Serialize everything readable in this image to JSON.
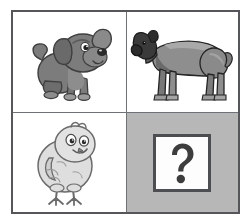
{
  "puzzle": {
    "title": "Animal analogy matrix",
    "type": "2x2 visual analogy",
    "relation": "young animal is to adult animal",
    "columns": [
      "young",
      "adult"
    ],
    "rows": [
      "dog",
      "bird"
    ],
    "cells": [
      {
        "position": "top-left",
        "row": 0,
        "col": 0,
        "icon": "puppy-icon",
        "label": "Puppy",
        "description": "Cartoon gray puppy sitting, facing right, floppy ears, curled tail",
        "shaded": false,
        "is_answer_slot": false,
        "colors": {
          "body": "#7c7c7c",
          "body_shadow": "#5e5e5e",
          "outline": "#3f3f3f",
          "nose": "#2a2a2a",
          "eye": "#1f1f1f",
          "belly": "#9a9a9a"
        }
      },
      {
        "position": "top-right",
        "row": 0,
        "col": 1,
        "icon": "adult-dog-icon",
        "label": "Adult dog",
        "description": "Grayscale mastiff standing in profile facing left, dark mask on muzzle",
        "shaded": false,
        "is_answer_slot": false,
        "colors": {
          "body": "#8e8e8e",
          "body_shadow": "#6a6a6a",
          "head": "#3a3a3a",
          "outline": "#242424",
          "highlight": "#a9a9a9"
        }
      },
      {
        "position": "bottom-left",
        "row": 1,
        "col": 0,
        "icon": "chick-icon",
        "label": "Chick",
        "description": "Cartoon fluffy baby chick standing, light body with pencil outline, two legs with toes",
        "shaded": false,
        "is_answer_slot": false,
        "colors": {
          "body": "#dedede",
          "body_shadow": "#c4c4c4",
          "outline": "#6b6b6b",
          "eye": "#2b2b2b",
          "beak": "#8a8a8a"
        }
      },
      {
        "position": "bottom-right",
        "row": 1,
        "col": 1,
        "icon": "question-mark-icon",
        "label": "?",
        "description": "Shaded answer cell containing a white box with a bold question mark",
        "shaded": true,
        "is_answer_slot": true,
        "colors": {
          "cell_background": "#b7b7b7",
          "box_background": "#fdfdfd",
          "box_border": "#4c4e51",
          "glyph": "#3d3d3d"
        }
      }
    ]
  },
  "frame": {
    "border_color": "#54565a",
    "divider_color": "#6e7276",
    "page_background": "#ffffff"
  }
}
